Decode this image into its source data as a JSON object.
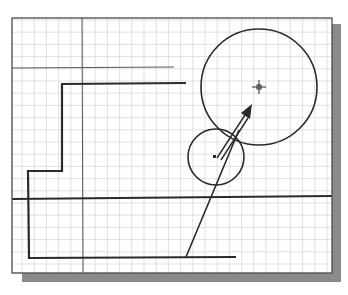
{
  "colors": {
    "background": "#ffffff",
    "grid": "#d9d9d9",
    "frame": "#555555",
    "shadow": "#8a8a8a",
    "geometry": "#2a2a2a"
  },
  "drawing": {
    "grid_enabled": true,
    "objects": [
      {
        "name": "construction-line-vertical",
        "type": "xline",
        "orientation": "vertical"
      },
      {
        "name": "construction-line-horizontal",
        "type": "xline",
        "orientation": "horizontal"
      },
      {
        "name": "thick-horizontal-line",
        "type": "line",
        "orientation": "horizontal"
      },
      {
        "name": "stepped-polyline",
        "type": "polyline",
        "segments": 5
      },
      {
        "name": "large-circle",
        "type": "circle"
      },
      {
        "name": "small-circle",
        "type": "circle"
      },
      {
        "name": "inclined-line",
        "type": "line"
      },
      {
        "name": "direction-arrow",
        "type": "arrow"
      },
      {
        "name": "crosshair-cursor",
        "type": "cursor"
      },
      {
        "name": "grip-point",
        "type": "marker"
      }
    ]
  }
}
